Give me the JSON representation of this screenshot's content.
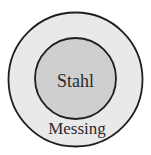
{
  "diagram": {
    "type": "concentric-circles",
    "outer": {
      "label": "Messing",
      "fill": "#e9e9e9",
      "stroke": "#1e1e1e"
    },
    "inner": {
      "label": "Stahl",
      "fill": "#cfcfcf",
      "stroke": "#1e1e1e"
    }
  }
}
